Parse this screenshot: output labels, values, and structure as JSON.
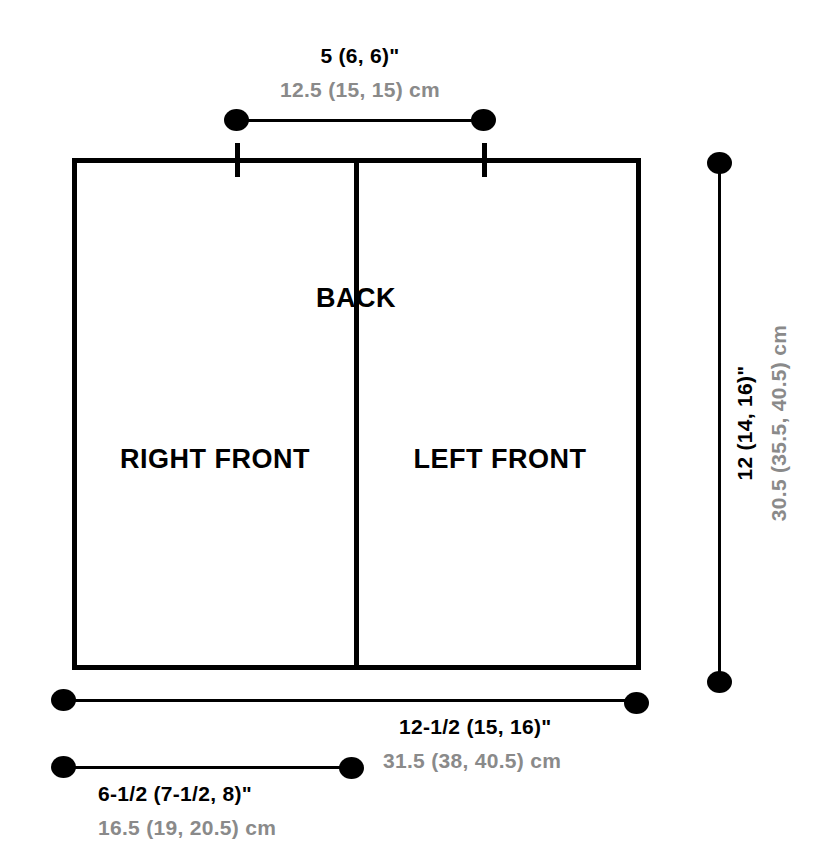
{
  "diagram": {
    "colors": {
      "outline": "#000000",
      "imperial_text": "#000000",
      "metric_text": "#8a8a8a",
      "background": "#ffffff"
    },
    "panels": [
      {
        "id": "back",
        "label": "BACK"
      },
      {
        "id": "right-front",
        "label": "RIGHT FRONT"
      },
      {
        "id": "left-front",
        "label": "LEFT FRONT"
      }
    ],
    "measurements": [
      {
        "id": "neck-width",
        "position": "top",
        "imperial": "5 (6, 6)\"",
        "metric": "12.5 (15, 15) cm"
      },
      {
        "id": "body-length",
        "position": "right",
        "orientation": "vertical",
        "imperial": "12 (14, 16)\"",
        "metric": "30.5 (35.5, 40.5) cm"
      },
      {
        "id": "full-width",
        "position": "bottom",
        "imperial": "12-1/2 (15, 16)\"",
        "metric": "31.5 (38, 40.5) cm"
      },
      {
        "id": "front-width",
        "position": "bottom-lower",
        "imperial": "6-1/2 (7-1/2, 8)\"",
        "metric": "16.5 (19, 20.5) cm"
      }
    ]
  }
}
